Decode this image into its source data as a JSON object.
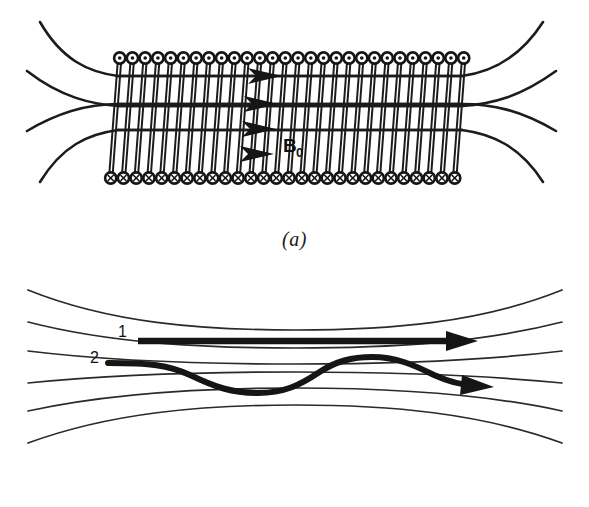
{
  "figure": {
    "background_color": "#ffffff",
    "ink_color": "#151515"
  },
  "panel_a": {
    "caption": "(a)",
    "field_label": "B",
    "field_label_subscript": "0",
    "coil_top_symbol": "current-out-of-page-dot",
    "coil_bottom_symbol": "current-into-page-cross",
    "coil_turns": 28,
    "interior_arrow_count": 4,
    "flare_lines_per_side": 4,
    "solenoid": {
      "left": 118,
      "right": 462,
      "top": 58,
      "bottom": 178
    }
  },
  "panel_b": {
    "caption": "(b)",
    "trajectories": [
      {
        "id": "1",
        "label": "1",
        "kind": "straight",
        "direction": "right"
      },
      {
        "id": "2",
        "label": "2",
        "kind": "oscillating",
        "direction": "right"
      }
    ],
    "field_line_count": 7
  },
  "chart_data": {
    "type": "line",
    "xlabel": "",
    "ylabel": "",
    "panels": [
      {
        "name": "(a)",
        "description": "Solenoid with current-carrying coils producing a uniform axial field B0 in the interior that flares outward at both ends.",
        "series": [
          {
            "name": "flare-line-upper-outer",
            "role": "magnetic-field-line"
          },
          {
            "name": "flare-line-upper-inner",
            "role": "magnetic-field-line"
          },
          {
            "name": "flare-line-lower-inner",
            "role": "magnetic-field-line"
          },
          {
            "name": "flare-line-lower-outer",
            "role": "magnetic-field-line"
          }
        ],
        "annotations": [
          "B0"
        ]
      },
      {
        "name": "(b)",
        "description": "Converging magnetic field lines with two charged-particle trajectories: trajectory 1 travels straight along a field line, trajectory 2 oscillates across field lines.",
        "series": [
          {
            "name": "trajectory-1",
            "role": "straight-particle-path"
          },
          {
            "name": "trajectory-2",
            "role": "oscillating-particle-path"
          }
        ],
        "annotations": [
          "1",
          "2"
        ]
      }
    ]
  }
}
